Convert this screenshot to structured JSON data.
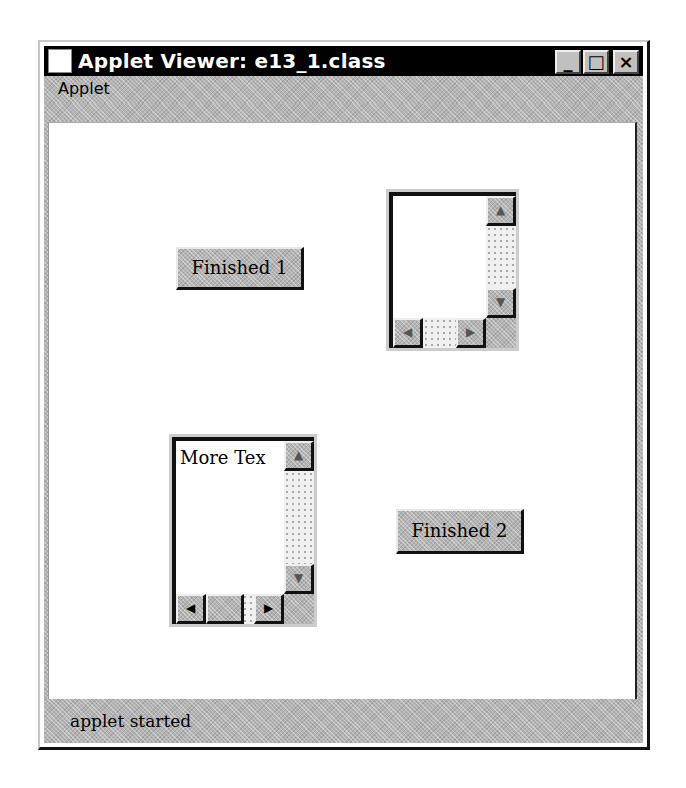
{
  "window": {
    "title": "Applet Viewer: e13_1.class",
    "controls": {
      "minimize": "_",
      "maximize": "□",
      "close": "×"
    }
  },
  "menubar": {
    "items": [
      {
        "label": "Applet"
      }
    ]
  },
  "applet": {
    "button1": {
      "label": "Finished 1"
    },
    "button2": {
      "label": "Finished 2"
    },
    "textarea1": {
      "value": ""
    },
    "textarea2": {
      "value": "More Tex"
    },
    "scroll_icons": {
      "up": "▲",
      "down": "▼",
      "left": "◀",
      "right": "▶"
    }
  },
  "statusbar": {
    "text": "applet started"
  }
}
